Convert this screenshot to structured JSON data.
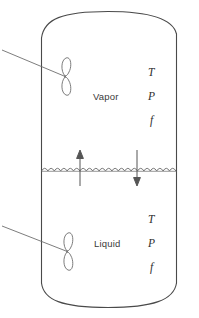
{
  "figure": {
    "colors": {
      "outline": "#4a4a4a",
      "interface": "#6b6b6b",
      "arrow": "#555555",
      "text": "#333333",
      "background": "#ffffff"
    }
  },
  "vessel": {
    "name": "equilibrium-cell",
    "shape": "rounded-cylinder"
  },
  "phases": {
    "vapor": {
      "label": "Vapor",
      "properties": [
        {
          "symbol": "T",
          "name": "temperature"
        },
        {
          "symbol": "P",
          "name": "pressure"
        },
        {
          "symbol": "f",
          "name": "fugacity"
        }
      ]
    },
    "liquid": {
      "label": "Liquid",
      "properties": [
        {
          "symbol": "T",
          "name": "temperature"
        },
        {
          "symbol": "P",
          "name": "pressure"
        },
        {
          "symbol": "f",
          "name": "fugacity"
        }
      ]
    }
  },
  "interface": {
    "name": "wavy-phase-boundary",
    "style": "scalloped-wave"
  },
  "arrows": {
    "up": {
      "name": "vaporization-arrow",
      "direction": "up"
    },
    "down": {
      "name": "condensation-arrow",
      "direction": "down"
    }
  },
  "stirrers": [
    {
      "name": "vapor-phase-stirrer",
      "blades": 2
    },
    {
      "name": "liquid-phase-stirrer",
      "blades": 2
    }
  ]
}
